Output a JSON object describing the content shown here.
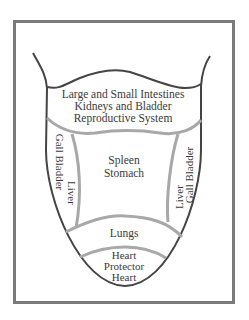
{
  "diagram": {
    "colors": {
      "frame": "#7a7a7a",
      "outline": "#444444",
      "divider": "#a8a8a8",
      "text": "#3a3a3a",
      "background": "#ffffff"
    },
    "regions": {
      "back": {
        "lines": [
          "Large and Small Intestines",
          "Kidneys and Bladder",
          "Reproductive System"
        ]
      },
      "left_side": {
        "outer": "Gall Bladder",
        "inner": "Liver"
      },
      "right_side": {
        "inner": "Liver",
        "outer": "Gall Bladder"
      },
      "center": {
        "lines": [
          "Spleen",
          "Stomach"
        ]
      },
      "front": {
        "label": "Lungs"
      },
      "tip": {
        "lines": [
          "Heart",
          "Protector",
          "Heart"
        ]
      }
    }
  }
}
